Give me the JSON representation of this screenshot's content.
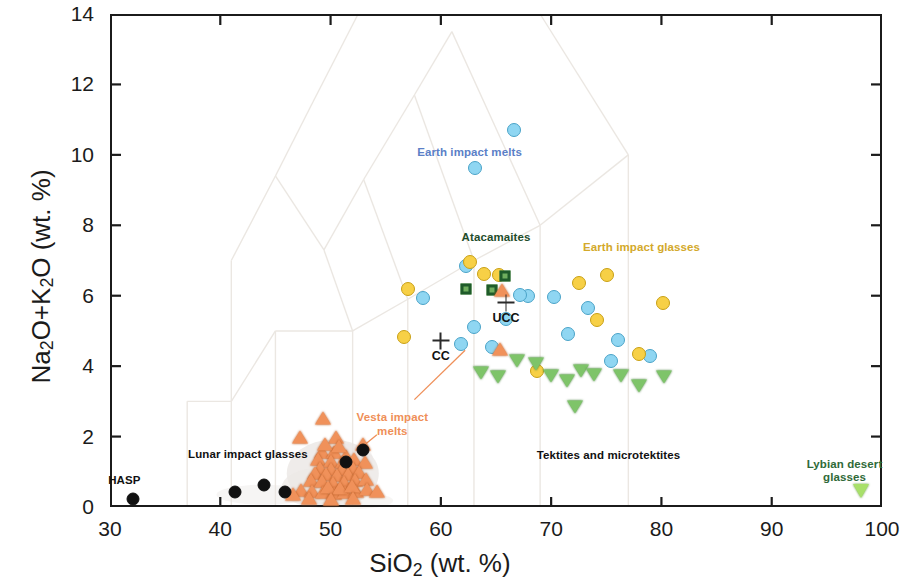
{
  "axes": {
    "x": {
      "label": "SiO2 (wt. %)",
      "label_html": "SiO<sub>2</sub> (wt. %)",
      "min": 30,
      "max": 100,
      "ticks": [
        30,
        40,
        50,
        60,
        70,
        80,
        90,
        100
      ]
    },
    "y": {
      "label": "Na2O+K2O (wt. %)",
      "label_html": "Na<sub>2</sub>O+K<sub>2</sub>O (wt. %)",
      "min": 0,
      "max": 14,
      "ticks": [
        0,
        2,
        4,
        6,
        8,
        10,
        12,
        14
      ]
    }
  },
  "colors": {
    "earth_impact_melts": "#8fd6f2",
    "earth_impact_melts_edge": "#4aa3c8",
    "earth_impact_glasses": "#f7d046",
    "earth_impact_glasses_edge": "#c9a015",
    "atacamaites": "#6fae5e",
    "atacamaites_edge": "#1f5b2a",
    "vesta_impact_melts": "#f0915a",
    "vesta_impact_melts_edge": "#b85a22",
    "lunar_impact_glasses": "#111111",
    "tektites": "#7ec469",
    "tektites_edge": "#3e7a33",
    "libyan_desert_glasses": "#a8e06a",
    "libyan_desert_glasses_edge": "#5f9a33",
    "reference_marker": "#2a2a2a",
    "axis": "#1b1b1b",
    "tas_field_lines": "#ebe7e2"
  },
  "annotations": [
    {
      "name": "earth-impact-melts",
      "text": "Earth impact melts",
      "x": 62.6,
      "y": 10.05,
      "color": "#5b7fc7",
      "align": "center"
    },
    {
      "name": "atacamaites",
      "text": "Atacamaites",
      "x": 65.0,
      "y": 7.63,
      "color": "#1f4d2b",
      "align": "center"
    },
    {
      "name": "earth-impact-glasses",
      "text": "Earth impact glasses",
      "x": 78.2,
      "y": 7.35,
      "color": "#d3a92b",
      "align": "center"
    },
    {
      "name": "vesta-impact-melts",
      "text": "Vesta impact\nmelts",
      "x": 55.6,
      "y": 2.52,
      "color": "#ef8f58",
      "align": "center"
    },
    {
      "name": "lunar-impact-glasses",
      "text": "Lunar impact glasses",
      "x": 42.5,
      "y": 1.47,
      "color": "#111111",
      "align": "center"
    },
    {
      "name": "hasp",
      "text": "HASP",
      "x": 31.3,
      "y": 0.74,
      "color": "#111111",
      "align": "center"
    },
    {
      "name": "tektites",
      "text": "Tektites and microtektites",
      "x": 75.2,
      "y": 1.45,
      "color": "#111111",
      "align": "center"
    },
    {
      "name": "libyan-desert-glasses",
      "text": "Lybian desert\nglasses",
      "x": 96.6,
      "y": 1.2,
      "color": "#2f6a38",
      "align": "center"
    }
  ],
  "leaders": [
    {
      "name": "vesta-leader-right",
      "x1": 57.6,
      "y1": 3.05,
      "x2": 62.2,
      "y2": 4.45,
      "color": "#ef8f58"
    },
    {
      "name": "vesta-leader-left",
      "x1": 54.2,
      "y1": 2.05,
      "x2": 52.9,
      "y2": 1.72,
      "color": "#ef8f58"
    }
  ],
  "reference_points": [
    {
      "name": "ucc",
      "label": "UCC",
      "x": 65.9,
      "y": 5.8
    },
    {
      "name": "cc",
      "label": "CC",
      "x": 60.0,
      "y": 4.72
    }
  ],
  "legend_series": [
    {
      "key": "earth_impact_melts",
      "name": "Earth impact melts",
      "marker": "circle",
      "color": "#8fd6f2"
    },
    {
      "key": "earth_impact_glasses",
      "name": "Earth impact glasses",
      "marker": "circle",
      "color": "#f7d046"
    },
    {
      "key": "atacamaites",
      "name": "Atacamaites",
      "marker": "square",
      "color": "#6fae5e"
    },
    {
      "key": "vesta_impact_melts",
      "name": "Vesta impact melts",
      "marker": "tri-up",
      "color": "#f0915a"
    },
    {
      "key": "lunar_impact_glasses",
      "name": "Lunar impact glasses",
      "marker": "circle",
      "color": "#111111"
    },
    {
      "key": "tektites",
      "name": "Tektites and microtektites",
      "marker": "tri-dn",
      "color": "#7ec469"
    },
    {
      "key": "libyan_desert_glasses",
      "name": "Lybian desert glasses",
      "marker": "tri-dn",
      "color": "#a8e06a"
    }
  ],
  "chart_data": {
    "type": "scatter",
    "title": "",
    "xlabel": "SiO2 (wt. %)",
    "ylabel": "Na2O+K2O (wt. %)",
    "xlim": [
      30,
      100
    ],
    "ylim": [
      0,
      14
    ],
    "xticks": [
      30,
      40,
      50,
      60,
      70,
      80,
      90,
      100
    ],
    "yticks": [
      0,
      2,
      4,
      6,
      8,
      10,
      12,
      14
    ],
    "grid": false,
    "legend": "inline-annotations",
    "series": [
      {
        "name": "Earth impact melts",
        "marker": "circle",
        "color": "#8fd6f2",
        "edge": "#4aa3c8",
        "size": 14,
        "points": [
          [
            66.6,
            10.7
          ],
          [
            63.1,
            9.62
          ],
          [
            62.3,
            6.83
          ],
          [
            58.4,
            5.93
          ],
          [
            61.8,
            4.62
          ],
          [
            65.9,
            5.33
          ],
          [
            67.9,
            5.98
          ],
          [
            67.2,
            6.02
          ],
          [
            70.3,
            5.95
          ],
          [
            73.3,
            5.64
          ],
          [
            71.5,
            4.92
          ],
          [
            76.1,
            4.74
          ],
          [
            75.4,
            4.14
          ],
          [
            79.0,
            4.3
          ],
          [
            64.6,
            4.54
          ],
          [
            63.0,
            5.12
          ]
        ]
      },
      {
        "name": "Earth impact glasses",
        "marker": "circle",
        "color": "#f7d046",
        "edge": "#c9a015",
        "size": 14,
        "points": [
          [
            57.0,
            6.2
          ],
          [
            56.7,
            4.82
          ],
          [
            62.6,
            6.95
          ],
          [
            63.9,
            6.62
          ],
          [
            65.3,
            6.58
          ],
          [
            72.5,
            6.37
          ],
          [
            75.1,
            6.58
          ],
          [
            74.2,
            5.3
          ],
          [
            80.1,
            5.78
          ],
          [
            78.0,
            4.34
          ],
          [
            68.7,
            3.86
          ]
        ]
      },
      {
        "name": "Atacamaites",
        "marker": "square",
        "color": "#6fae5e",
        "edge": "#1f5b2a",
        "size": 11,
        "points": [
          [
            62.3,
            6.18
          ],
          [
            64.6,
            6.16
          ],
          [
            65.8,
            6.55
          ]
        ]
      },
      {
        "name": "Vesta impact melts",
        "marker": "tri-up",
        "color": "#f0915a",
        "edge": "#b85a22",
        "size": 13,
        "points": [
          [
            65.5,
            6.1
          ],
          [
            65.4,
            4.42
          ],
          [
            49.3,
            2.46
          ],
          [
            47.2,
            1.93
          ],
          [
            50.5,
            1.93
          ],
          [
            52.9,
            1.72
          ],
          [
            49.2,
            1.5
          ],
          [
            50.3,
            1.5
          ],
          [
            51.4,
            1.38
          ],
          [
            48.9,
            1.3
          ],
          [
            50.0,
            1.25
          ],
          [
            51.1,
            1.22
          ],
          [
            52.1,
            1.3
          ],
          [
            53.1,
            1.22
          ],
          [
            49.0,
            1.05
          ],
          [
            50.0,
            1.02
          ],
          [
            51.0,
            1.0
          ],
          [
            52.0,
            1.05
          ],
          [
            48.6,
            0.9
          ],
          [
            49.6,
            0.86
          ],
          [
            50.6,
            0.84
          ],
          [
            51.6,
            0.88
          ],
          [
            52.6,
            0.92
          ],
          [
            48.2,
            0.7
          ],
          [
            49.2,
            0.66
          ],
          [
            50.2,
            0.62
          ],
          [
            51.2,
            0.64
          ],
          [
            52.2,
            0.7
          ],
          [
            53.2,
            0.74
          ],
          [
            47.3,
            0.42
          ],
          [
            48.3,
            0.38
          ],
          [
            49.3,
            0.36
          ],
          [
            50.3,
            0.34
          ],
          [
            51.3,
            0.36
          ],
          [
            52.3,
            0.4
          ],
          [
            53.3,
            0.44
          ],
          [
            54.2,
            0.4
          ],
          [
            46.6,
            0.3
          ],
          [
            49.8,
            0.5
          ],
          [
            50.9,
            0.48
          ],
          [
            51.9,
            0.52
          ],
          [
            48.0,
            0.18
          ],
          [
            50.0,
            0.16
          ],
          [
            52.0,
            0.18
          ],
          [
            49.5,
            1.72
          ],
          [
            50.8,
            1.68
          ]
        ]
      },
      {
        "name": "Lunar impact glasses",
        "marker": "circle",
        "color": "#111111",
        "edge": "#111111",
        "size": 13,
        "points": [
          [
            32.1,
            0.22
          ],
          [
            41.3,
            0.42
          ],
          [
            44.0,
            0.62
          ],
          [
            45.9,
            0.44
          ],
          [
            52.9,
            1.63
          ],
          [
            51.4,
            1.28
          ]
        ]
      },
      {
        "name": "Tektites and microtektites",
        "marker": "tri-dn",
        "color": "#7ec469",
        "edge": "#3e7a33",
        "size": 13,
        "points": [
          [
            63.6,
            3.68
          ],
          [
            65.2,
            3.58
          ],
          [
            68.6,
            3.94
          ],
          [
            70.0,
            3.6
          ],
          [
            71.4,
            3.44
          ],
          [
            72.7,
            3.75
          ],
          [
            73.9,
            3.62
          ],
          [
            72.2,
            2.72
          ],
          [
            76.3,
            3.6
          ],
          [
            78.0,
            3.3
          ],
          [
            80.2,
            3.58
          ],
          [
            66.9,
            4.03
          ]
        ]
      },
      {
        "name": "Lybian desert glasses",
        "marker": "tri-dn",
        "color": "#a8e06a",
        "edge": "#5f9a33",
        "size": 14,
        "points": [
          [
            98.1,
            0.32
          ]
        ]
      }
    ],
    "reference_points": [
      {
        "label": "UCC",
        "x": 65.9,
        "y": 5.8,
        "marker": "plus"
      },
      {
        "label": "CC",
        "x": 60.0,
        "y": 4.72,
        "marker": "plus"
      }
    ]
  }
}
